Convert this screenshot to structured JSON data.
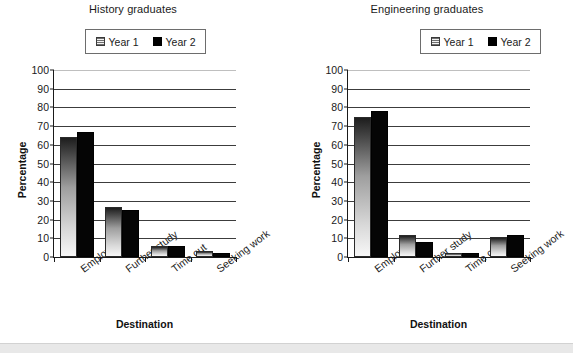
{
  "chart_data": [
    {
      "type": "bar",
      "title": "History graduates",
      "xlabel": "Destination",
      "ylabel": "Percentage",
      "categories": [
        "Employed",
        "Further study",
        "Time out",
        "Seeking work"
      ],
      "series": [
        {
          "name": "Year 1",
          "values": [
            64,
            27,
            6,
            3
          ]
        },
        {
          "name": "Year 2",
          "values": [
            67,
            25,
            6,
            2
          ]
        }
      ],
      "ylim": [
        0,
        100
      ],
      "yticks": [
        0,
        10,
        20,
        30,
        40,
        50,
        60,
        70,
        80,
        90,
        100
      ],
      "grid": true,
      "legend_position": "top-center"
    },
    {
      "type": "bar",
      "title": "Engineering graduates",
      "xlabel": "Destination",
      "ylabel": "Percentage",
      "categories": [
        "Employed",
        "Further study",
        "Time out",
        "Seeking work"
      ],
      "series": [
        {
          "name": "Year 1",
          "values": [
            75,
            12,
            2,
            10.5
          ]
        },
        {
          "name": "Year 2",
          "values": [
            78,
            8,
            2,
            12
          ]
        }
      ],
      "ylim": [
        0,
        100
      ],
      "yticks": [
        0,
        10,
        20,
        30,
        40,
        50,
        60,
        70,
        80,
        90,
        100
      ],
      "grid": true,
      "legend_position": "top-center"
    }
  ],
  "charts": [
    {
      "title": "History graduates",
      "legend": {
        "year1": "Year 1",
        "year2": "Year 2"
      },
      "y_axis_title": "Percentage",
      "x_axis_title": "Destination",
      "y_ticks": [
        "100",
        "90",
        "80",
        "70",
        "60",
        "50",
        "40",
        "30",
        "20",
        "10",
        "0"
      ],
      "categories": [
        "Employed",
        "Further study",
        "Time out",
        "Seeking work"
      ]
    },
    {
      "title": "Engineering graduates",
      "legend": {
        "year1": "Year 1",
        "year2": "Year 2"
      },
      "y_axis_title": "Percentage",
      "x_axis_title": "Destination",
      "y_ticks": [
        "100",
        "90",
        "80",
        "70",
        "60",
        "50",
        "40",
        "30",
        "20",
        "10",
        "0"
      ],
      "categories": [
        "Employed",
        "Further study",
        "Time out",
        "Seeking work"
      ]
    }
  ]
}
